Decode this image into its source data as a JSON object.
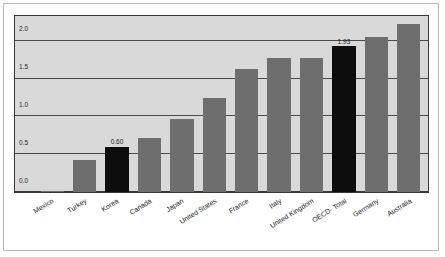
{
  "chart_data": {
    "type": "bar",
    "title": "",
    "subtitle": "",
    "xlabel": "",
    "ylabel": "",
    "ylim": [
      0.0,
      2.33
    ],
    "grid": true,
    "legend": null,
    "legend_position": "none",
    "yticks": [
      "2.0",
      "1.5",
      "1.0",
      "0.5",
      "0.0"
    ],
    "ytick_values": [
      2.0,
      1.5,
      1.0,
      0.5,
      0.0
    ],
    "categories": [
      "Mexico",
      "Turkey",
      "Korea",
      "Canada",
      "Japan",
      "United States",
      "France",
      "Italy",
      "United Kingdom",
      "OECD- Total",
      "Germany",
      "Australia"
    ],
    "values": [
      0.02,
      0.42,
      0.6,
      0.72,
      0.97,
      1.25,
      1.63,
      1.78,
      1.78,
      1.93,
      2.05,
      2.22
    ],
    "bar_colors": [
      "#6e6e6e",
      "#6e6e6e",
      "#0d0d0d",
      "#6e6e6e",
      "#6e6e6e",
      "#6e6e6e",
      "#6e6e6e",
      "#6e6e6e",
      "#6e6e6e",
      "#0d0d0d",
      "#6e6e6e",
      "#6e6e6e"
    ],
    "data_labels": [
      "",
      "",
      "0.60",
      "",
      "",
      "",
      "",
      "",
      "",
      "1.93",
      "",
      ""
    ],
    "plot_background": "#d9d9d9",
    "accent_color": "#0d0d0d",
    "bar_color": "#6e6e6e"
  }
}
